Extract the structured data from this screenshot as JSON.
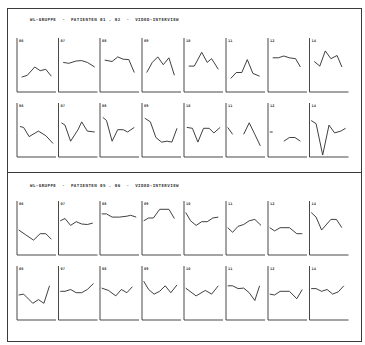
{
  "sections": [
    {
      "title": "WL-GRUPPE  ·  PATIENTEN 01 . 02  ·  VIDEO-INTERVIEW"
    },
    {
      "title": "WL-GRUPPE  ·  PATIENTEN 05 . 06  ·  VIDEO-INTERVIEW"
    }
  ],
  "chart_data": {
    "type": "line",
    "layout": {
      "sections": 2,
      "rows_per_section": 2,
      "cols": 8,
      "grid": false,
      "axis_ticks": false,
      "y_normalized": "0=top, 1=bottom of plot area"
    },
    "panel_labels": [
      "06",
      "07",
      "08",
      "09",
      "10",
      "11",
      "12",
      "14"
    ],
    "panels": [
      {
        "section": 0,
        "row": 0,
        "label": "06",
        "points": [
          [
            0.1,
            0.72
          ],
          [
            0.25,
            0.68
          ],
          [
            0.45,
            0.5
          ],
          [
            0.6,
            0.58
          ],
          [
            0.75,
            0.55
          ],
          [
            0.9,
            0.7
          ]
        ]
      },
      {
        "section": 0,
        "row": 0,
        "label": "07",
        "points": [
          [
            0.1,
            0.4
          ],
          [
            0.25,
            0.42
          ],
          [
            0.45,
            0.37
          ],
          [
            0.6,
            0.36
          ],
          [
            0.75,
            0.4
          ],
          [
            0.95,
            0.5
          ]
        ]
      },
      {
        "section": 0,
        "row": 0,
        "label": "08",
        "points": [
          [
            0.1,
            0.35
          ],
          [
            0.3,
            0.38
          ],
          [
            0.45,
            0.28
          ],
          [
            0.6,
            0.33
          ],
          [
            0.75,
            0.34
          ],
          [
            0.9,
            0.62
          ]
        ]
      },
      {
        "section": 0,
        "row": 0,
        "label": "09",
        "points": [
          [
            0.1,
            0.62
          ],
          [
            0.25,
            0.4
          ],
          [
            0.4,
            0.28
          ],
          [
            0.55,
            0.45
          ],
          [
            0.7,
            0.3
          ],
          [
            0.85,
            0.68
          ]
        ]
      },
      {
        "section": 0,
        "row": 0,
        "label": "10",
        "points": [
          [
            0.1,
            0.48
          ],
          [
            0.25,
            0.48
          ],
          [
            0.45,
            0.18
          ],
          [
            0.6,
            0.4
          ],
          [
            0.72,
            0.32
          ],
          [
            0.9,
            0.55
          ]
        ]
      },
      {
        "section": 0,
        "row": 0,
        "label": "11",
        "points": [
          [
            0.1,
            0.75
          ],
          [
            0.25,
            0.62
          ],
          [
            0.4,
            0.62
          ],
          [
            0.55,
            0.34
          ],
          [
            0.7,
            0.64
          ],
          [
            0.88,
            0.7
          ]
        ]
      },
      {
        "section": 0,
        "row": 0,
        "label": "12",
        "points": [
          [
            0.1,
            0.3
          ],
          [
            0.25,
            0.3
          ],
          [
            0.4,
            0.26
          ],
          [
            0.55,
            0.3
          ],
          [
            0.72,
            0.32
          ],
          [
            0.85,
            0.5
          ]
        ]
      },
      {
        "section": 0,
        "row": 0,
        "label": "14",
        "points": [
          [
            0.1,
            0.38
          ],
          [
            0.25,
            0.48
          ],
          [
            0.4,
            0.15
          ],
          [
            0.55,
            0.32
          ],
          [
            0.72,
            0.25
          ],
          [
            0.85,
            0.5
          ]
        ]
      },
      {
        "section": 0,
        "row": 1,
        "label": "06",
        "points": [
          [
            0.05,
            0.38
          ],
          [
            0.15,
            0.4
          ],
          [
            0.3,
            0.6
          ],
          [
            0.55,
            0.48
          ],
          [
            0.75,
            0.58
          ],
          [
            0.95,
            0.75
          ]
        ]
      },
      {
        "section": 0,
        "row": 1,
        "label": "07",
        "points": [
          [
            0.05,
            0.3
          ],
          [
            0.15,
            0.35
          ],
          [
            0.3,
            0.7
          ],
          [
            0.5,
            0.45
          ],
          [
            0.6,
            0.28
          ],
          [
            0.75,
            0.48
          ],
          [
            0.95,
            0.5
          ]
        ]
      },
      {
        "section": 0,
        "row": 1,
        "label": "08",
        "points": [
          [
            0.05,
            0.18
          ],
          [
            0.15,
            0.25
          ],
          [
            0.3,
            0.7
          ],
          [
            0.45,
            0.45
          ],
          [
            0.6,
            0.45
          ],
          [
            0.72,
            0.5
          ],
          [
            0.9,
            0.4
          ]
        ]
      },
      {
        "section": 0,
        "row": 1,
        "label": "09",
        "points": [
          [
            0.05,
            0.2
          ],
          [
            0.2,
            0.28
          ],
          [
            0.35,
            0.62
          ],
          [
            0.5,
            0.72
          ],
          [
            0.65,
            0.7
          ],
          [
            0.78,
            0.72
          ],
          [
            0.92,
            0.42
          ]
        ]
      },
      {
        "section": 0,
        "row": 1,
        "label": "10",
        "points": [
          [
            0.05,
            0.4
          ],
          [
            0.2,
            0.42
          ],
          [
            0.35,
            0.72
          ],
          [
            0.5,
            0.42
          ],
          [
            0.65,
            0.42
          ],
          [
            0.78,
            0.52
          ],
          [
            0.95,
            0.4
          ]
        ]
      },
      {
        "section": 0,
        "row": 1,
        "label": "11",
        "points": [
          [
            0.02,
            0.4
          ],
          [
            0.15,
            0.55
          ]
        ],
        "points2": [
          [
            0.45,
            0.55
          ],
          [
            0.6,
            0.3
          ],
          [
            0.75,
            0.55
          ],
          [
            0.9,
            0.8
          ]
        ]
      },
      {
        "section": 0,
        "row": 1,
        "label": "12",
        "points": [
          [
            0.02,
            0.5
          ],
          [
            0.1,
            0.5
          ]
        ],
        "points2": [
          [
            0.4,
            0.7
          ],
          [
            0.55,
            0.62
          ],
          [
            0.7,
            0.62
          ],
          [
            0.85,
            0.7
          ]
        ]
      },
      {
        "section": 0,
        "row": 1,
        "label": "14",
        "points": [
          [
            0.02,
            0.25
          ],
          [
            0.15,
            0.32
          ],
          [
            0.33,
            1.0
          ],
          [
            0.5,
            0.35
          ],
          [
            0.65,
            0.52
          ],
          [
            0.82,
            0.48
          ],
          [
            0.95,
            0.42
          ]
        ]
      },
      {
        "section": 1,
        "row": 0,
        "label": "06",
        "points": [
          [
            0.02,
            0.5
          ],
          [
            0.2,
            0.6
          ],
          [
            0.42,
            0.72
          ],
          [
            0.6,
            0.58
          ],
          [
            0.75,
            0.58
          ],
          [
            0.9,
            0.7
          ]
        ]
      },
      {
        "section": 1,
        "row": 0,
        "label": "07",
        "points": [
          [
            0.02,
            0.3
          ],
          [
            0.15,
            0.25
          ],
          [
            0.3,
            0.4
          ],
          [
            0.45,
            0.32
          ],
          [
            0.6,
            0.37
          ],
          [
            0.75,
            0.38
          ],
          [
            0.9,
            0.35
          ]
        ]
      },
      {
        "section": 1,
        "row": 0,
        "label": "08",
        "points": [
          [
            0.02,
            0.15
          ],
          [
            0.15,
            0.15
          ],
          [
            0.3,
            0.22
          ],
          [
            0.5,
            0.22
          ],
          [
            0.7,
            0.2
          ],
          [
            0.8,
            0.18
          ],
          [
            0.95,
            0.22
          ]
        ]
      },
      {
        "section": 1,
        "row": 0,
        "label": "09",
        "points": [
          [
            0.02,
            0.3
          ],
          [
            0.15,
            0.24
          ],
          [
            0.28,
            0.24
          ],
          [
            0.45,
            0.05
          ],
          [
            0.7,
            0.05
          ],
          [
            0.85,
            0.25
          ]
        ]
      },
      {
        "section": 1,
        "row": 0,
        "label": "10",
        "points": [
          [
            0.02,
            0.12
          ],
          [
            0.15,
            0.3
          ],
          [
            0.3,
            0.4
          ],
          [
            0.45,
            0.32
          ],
          [
            0.6,
            0.32
          ],
          [
            0.75,
            0.24
          ],
          [
            0.9,
            0.22
          ]
        ]
      },
      {
        "section": 1,
        "row": 0,
        "label": "11",
        "points": [
          [
            0.02,
            0.45
          ],
          [
            0.15,
            0.55
          ],
          [
            0.3,
            0.42
          ],
          [
            0.45,
            0.38
          ],
          [
            0.6,
            0.3
          ],
          [
            0.75,
            0.27
          ],
          [
            0.92,
            0.4
          ]
        ]
      },
      {
        "section": 1,
        "row": 0,
        "label": "12",
        "points": [
          [
            0.02,
            0.45
          ],
          [
            0.15,
            0.52
          ],
          [
            0.3,
            0.45
          ],
          [
            0.55,
            0.45
          ],
          [
            0.75,
            0.58
          ],
          [
            0.9,
            0.58
          ]
        ]
      },
      {
        "section": 1,
        "row": 0,
        "label": "14",
        "points": [
          [
            0.02,
            0.12
          ],
          [
            0.15,
            0.22
          ],
          [
            0.3,
            0.5
          ],
          [
            0.55,
            0.27
          ],
          [
            0.7,
            0.27
          ],
          [
            0.85,
            0.45
          ]
        ]
      },
      {
        "section": 1,
        "row": 1,
        "label": "06",
        "points": [
          [
            0.02,
            0.5
          ],
          [
            0.15,
            0.48
          ],
          [
            0.4,
            0.68
          ],
          [
            0.55,
            0.6
          ],
          [
            0.7,
            0.68
          ],
          [
            0.85,
            0.3
          ]
        ]
      },
      {
        "section": 1,
        "row": 1,
        "label": "07",
        "points": [
          [
            0.02,
            0.42
          ],
          [
            0.15,
            0.42
          ],
          [
            0.3,
            0.38
          ],
          [
            0.45,
            0.45
          ],
          [
            0.6,
            0.45
          ],
          [
            0.75,
            0.38
          ],
          [
            0.92,
            0.25
          ]
        ]
      },
      {
        "section": 1,
        "row": 1,
        "label": "08",
        "points": [
          [
            0.02,
            0.35
          ],
          [
            0.2,
            0.4
          ],
          [
            0.4,
            0.52
          ],
          [
            0.55,
            0.38
          ],
          [
            0.7,
            0.45
          ],
          [
            0.85,
            0.32
          ]
        ]
      },
      {
        "section": 1,
        "row": 1,
        "label": "09",
        "points": [
          [
            0.02,
            0.2
          ],
          [
            0.15,
            0.38
          ],
          [
            0.3,
            0.48
          ],
          [
            0.45,
            0.42
          ],
          [
            0.6,
            0.3
          ],
          [
            0.75,
            0.45
          ],
          [
            0.92,
            0.28
          ]
        ]
      },
      {
        "section": 1,
        "row": 1,
        "label": "10",
        "points": [
          [
            0.02,
            0.35
          ],
          [
            0.3,
            0.52
          ],
          [
            0.55,
            0.4
          ],
          [
            0.72,
            0.48
          ],
          [
            0.9,
            0.3
          ]
        ]
      },
      {
        "section": 1,
        "row": 1,
        "label": "11",
        "points": [
          [
            0.02,
            0.3
          ],
          [
            0.15,
            0.3
          ],
          [
            0.3,
            0.36
          ],
          [
            0.45,
            0.35
          ],
          [
            0.6,
            0.45
          ],
          [
            0.75,
            0.62
          ],
          [
            0.88,
            0.3
          ]
        ]
      },
      {
        "section": 1,
        "row": 1,
        "label": "12",
        "points": [
          [
            0.02,
            0.48
          ],
          [
            0.15,
            0.5
          ],
          [
            0.3,
            0.42
          ],
          [
            0.55,
            0.42
          ],
          [
            0.75,
            0.58
          ],
          [
            0.9,
            0.38
          ]
        ]
      },
      {
        "section": 1,
        "row": 1,
        "label": "14",
        "points": [
          [
            0.02,
            0.36
          ],
          [
            0.15,
            0.36
          ],
          [
            0.3,
            0.42
          ],
          [
            0.45,
            0.38
          ],
          [
            0.6,
            0.48
          ],
          [
            0.75,
            0.43
          ],
          [
            0.9,
            0.3
          ]
        ]
      }
    ]
  }
}
